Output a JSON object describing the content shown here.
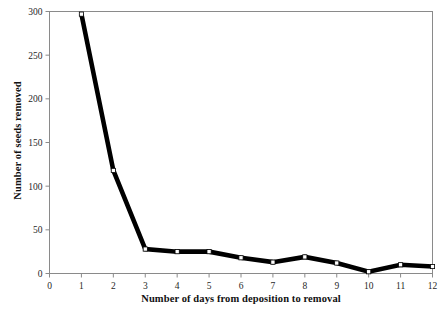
{
  "chart_data": {
    "type": "line",
    "title": "",
    "xlabel": "Number of days from deposition to removal",
    "ylabel": "Number of seeds removed",
    "x": [
      1,
      2,
      3,
      4,
      5,
      6,
      7,
      8,
      9,
      10,
      11,
      12
    ],
    "values": [
      297,
      118,
      28,
      25,
      25,
      18,
      13,
      19,
      12,
      2,
      10,
      8
    ],
    "series": [
      {
        "name": "Seeds removed",
        "values": [
          297,
          118,
          28,
          25,
          25,
          18,
          13,
          19,
          12,
          2,
          10,
          8
        ]
      }
    ],
    "xlim": [
      0,
      12
    ],
    "ylim": [
      0,
      300
    ],
    "xticks": [
      0,
      1,
      2,
      3,
      4,
      5,
      6,
      7,
      8,
      9,
      10,
      11,
      12
    ],
    "yticks": [
      0,
      50,
      100,
      150,
      200,
      250,
      300
    ],
    "xtick_labels": [
      "0",
      "1",
      "2",
      "3",
      "4",
      "5",
      "6",
      "7",
      "8",
      "9",
      "10",
      "11",
      "12"
    ],
    "ytick_labels": [
      "0",
      "50",
      "100",
      "150",
      "200",
      "250",
      "300"
    ],
    "grid": false,
    "legend": false,
    "legend_position": "none",
    "line_color": "#000000",
    "marker_face_color": "#ffffff",
    "marker_edge_color": "#000000",
    "marker": "square",
    "frame_color": "#8a8a8a",
    "background_color": "#ffffff"
  }
}
